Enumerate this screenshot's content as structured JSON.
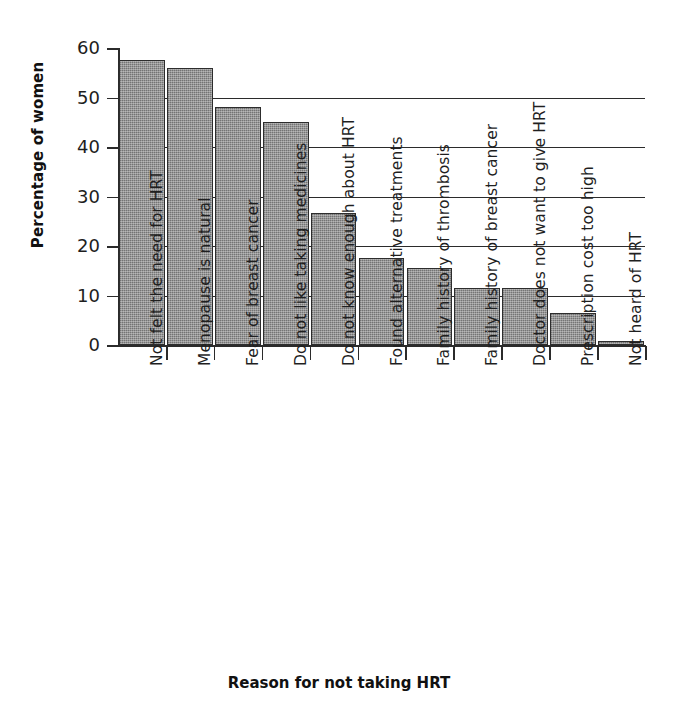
{
  "chart_data": {
    "type": "bar",
    "title": "",
    "xlabel": "Reason for not taking HRT",
    "ylabel": "Percentage of women",
    "ylim": [
      0,
      60
    ],
    "yticks": [
      0,
      10,
      20,
      30,
      40,
      50,
      60
    ],
    "grid": true,
    "legend": "none",
    "bar_color": "#8a8a8a",
    "bar_edge_color": "#2d2d2d",
    "axis_color": "#2b2b2b",
    "categories": [
      "Not felt the need for HRT",
      "Menopause is natural",
      "Fear of breast cancer",
      "Do not like taking medicines",
      "Do not know enough about HRT",
      "Found alternative treatments",
      "Family history of thrombosis",
      "Family history of breast cancer",
      "Doctor does not want to give HRT",
      "Prescription cost too high",
      "Not heard of HRT"
    ],
    "values": [
      57.5,
      56.0,
      48.0,
      45.0,
      26.6,
      17.5,
      15.5,
      11.5,
      11.5,
      6.4,
      0.8
    ]
  }
}
